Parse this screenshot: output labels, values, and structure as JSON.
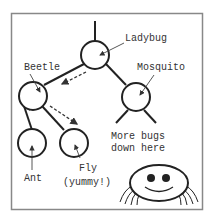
{
  "diagram": {
    "nodes": [
      {
        "id": "ladybug",
        "label": "Ladybug"
      },
      {
        "id": "beetle",
        "label": "Beetle"
      },
      {
        "id": "mosquito",
        "label": "Mosquito"
      },
      {
        "id": "ant",
        "label": "Ant"
      },
      {
        "id": "fly",
        "label": "Fly",
        "sublabel": "(yummy!)"
      }
    ],
    "edges": [
      {
        "from": "ladybug",
        "to": "beetle"
      },
      {
        "from": "ladybug",
        "to": "mosquito"
      },
      {
        "from": "beetle",
        "to": "ant"
      },
      {
        "from": "beetle",
        "to": "fly"
      }
    ],
    "traversal_path": [
      "ladybug",
      "beetle",
      "fly"
    ],
    "more_note_line1": "More bugs",
    "more_note_line2": "down here",
    "mascot": "spider-icon",
    "colors": {
      "stroke": "#222222",
      "frame": "#888888",
      "text": "#333333",
      "background": "#ffffff"
    }
  }
}
